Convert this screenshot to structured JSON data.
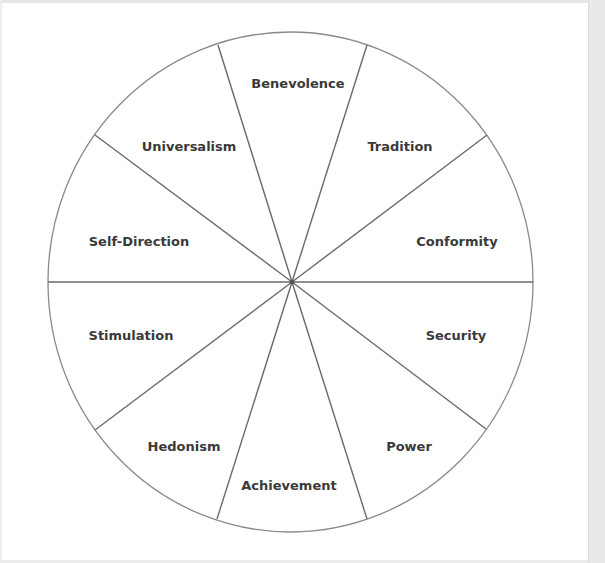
{
  "diagram": {
    "type": "value-wheel",
    "center": {
      "x": 292,
      "y": 282
    },
    "radius_x": 243,
    "radius_y": 250,
    "colors": {
      "outline": "#8a8a8a",
      "divider": "#6a6a6a",
      "text": "#3a3a3a",
      "background": "#ffffff"
    },
    "segments": [
      {
        "label": "Benevolence",
        "x": 298,
        "y": 83
      },
      {
        "label": "Tradition",
        "x": 400,
        "y": 146
      },
      {
        "label": "Conformity",
        "x": 457,
        "y": 241
      },
      {
        "label": "Security",
        "x": 456,
        "y": 335
      },
      {
        "label": "Power",
        "x": 409,
        "y": 446
      },
      {
        "label": "Achievement",
        "x": 289,
        "y": 485
      },
      {
        "label": "Hedonism",
        "x": 184,
        "y": 446
      },
      {
        "label": "Stimulation",
        "x": 131,
        "y": 335
      },
      {
        "label": "Self-Direction",
        "x": 139,
        "y": 241
      },
      {
        "label": "Universalism",
        "x": 189,
        "y": 146
      }
    ],
    "dividers": [
      {
        "x": 218,
        "y": 45
      },
      {
        "x": 367,
        "y": 45
      },
      {
        "x": 487,
        "y": 135
      },
      {
        "x": 533,
        "y": 282
      },
      {
        "x": 486,
        "y": 429
      },
      {
        "x": 367,
        "y": 519
      },
      {
        "x": 217,
        "y": 519
      },
      {
        "x": 95,
        "y": 430
      },
      {
        "x": 48,
        "y": 282
      },
      {
        "x": 95,
        "y": 135
      }
    ]
  }
}
